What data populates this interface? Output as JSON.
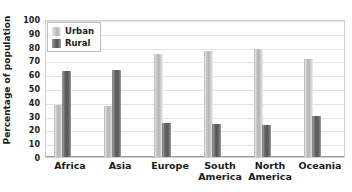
{
  "chart_data": {
    "type": "bar",
    "title": "",
    "xlabel": "",
    "ylabel": "Percentage of population",
    "ylim": [
      0,
      100
    ],
    "yticks": [
      0,
      10,
      20,
      30,
      40,
      50,
      60,
      70,
      80,
      90,
      100
    ],
    "grid": true,
    "legend_position": "top-left",
    "categories": [
      "Africa",
      "Asia",
      "Europe",
      "South America",
      "North America",
      "Oceania"
    ],
    "category_lines": [
      [
        "Africa"
      ],
      [
        "Asia"
      ],
      [
        "Europe"
      ],
      [
        "South",
        "America"
      ],
      [
        "North",
        "America"
      ],
      [
        "Oceania"
      ]
    ],
    "series": [
      {
        "name": "Urban",
        "color": "#c0c0c0",
        "values": [
          38,
          37,
          75,
          77,
          78,
          71
        ]
      },
      {
        "name": "Rural",
        "color": "#585858",
        "values": [
          62,
          63,
          25,
          24,
          23,
          30
        ]
      }
    ]
  },
  "legend": {
    "items": [
      {
        "label": "Urban"
      },
      {
        "label": "Rural"
      }
    ]
  }
}
